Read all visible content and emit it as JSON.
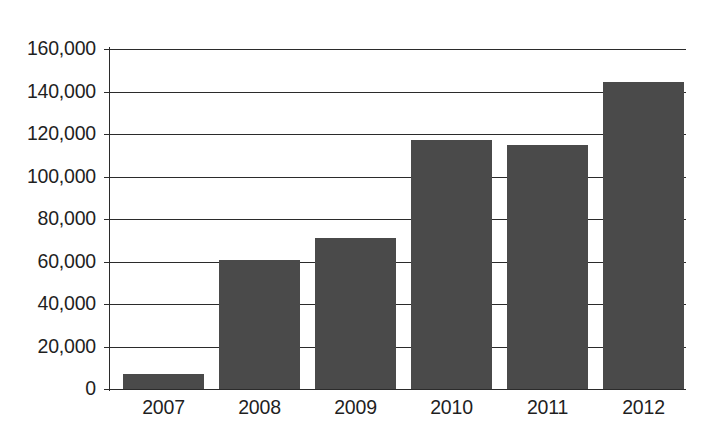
{
  "chart_data": {
    "type": "bar",
    "title": "",
    "subtitle": "",
    "xlabel": "",
    "ylabel": "",
    "categories": [
      "2007",
      "2008",
      "2009",
      "2010",
      "2011",
      "2012"
    ],
    "values": [
      7000,
      60500,
      71000,
      117000,
      115000,
      144500
    ],
    "series": [
      {
        "name": "",
        "values": [
          7000,
          60500,
          71000,
          117000,
          115000,
          144500
        ]
      }
    ],
    "ylim": [
      0,
      160000
    ],
    "ytick_values": [
      0,
      20000,
      40000,
      60000,
      80000,
      100000,
      120000,
      140000,
      160000
    ],
    "ytick_labels": [
      "0",
      "20,000",
      "40,000",
      "60,000",
      "80,000",
      "100,000",
      "120,000",
      "140,000",
      "160,000"
    ],
    "grid": true,
    "grid_axis": "y",
    "legend": false,
    "legend_position": "none",
    "bar_color": "#4a4a4a",
    "axis_color": "#2b2b2b",
    "background_color": "#ffffff",
    "annotations": []
  }
}
